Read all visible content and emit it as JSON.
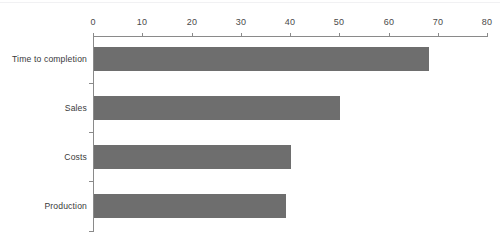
{
  "chart_data": {
    "type": "bar",
    "orientation": "horizontal",
    "title": "",
    "subtitle": "",
    "xlabel": "",
    "ylabel": "",
    "categories": [
      "Time to completion",
      "Sales",
      "Costs",
      "Production"
    ],
    "values": [
      68,
      50,
      40,
      39
    ],
    "series": [
      {
        "name": "",
        "values": [
          68,
          50,
          40,
          39
        ]
      }
    ],
    "xlim": [
      0,
      80
    ],
    "xticks": [
      0,
      10,
      20,
      30,
      40,
      50,
      60,
      70,
      80
    ],
    "xtick_labels": [
      "0",
      "10",
      "20",
      "30",
      "40",
      "50",
      "60",
      "70",
      "80"
    ],
    "grid": false,
    "legend": false,
    "legend_position": "none",
    "bar_color": "#6e6e6e",
    "axis_color": "#8a8a8a",
    "text_color": "#3a3a3a",
    "background_color": "#ffffff",
    "x_axis_position": "top",
    "annotations": []
  }
}
